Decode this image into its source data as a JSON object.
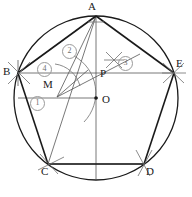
{
  "figure": {
    "type": "geometry-construction",
    "canvas": {
      "width": 192,
      "height": 197
    },
    "colors": {
      "stroke": "#1a1a1a",
      "thin": "#555555",
      "arc": "#6f6f6f",
      "circle_label": "#6f6f6f",
      "background": "#ffffff"
    },
    "circle": {
      "cx": 96,
      "cy": 98,
      "r": 82
    },
    "points": [
      {
        "name": "A",
        "label": "A",
        "x": 96,
        "y": 16,
        "label_x": 91,
        "label_y": 2,
        "dot": false
      },
      {
        "name": "B",
        "label": "B",
        "x": 18,
        "y": 73,
        "label_x": 4,
        "label_y": 68,
        "dot": false
      },
      {
        "name": "C",
        "label": "C",
        "x": 48,
        "y": 164,
        "label_x": 42,
        "label_y": 166,
        "dot": false
      },
      {
        "name": "D",
        "label": "D",
        "x": 144,
        "y": 164,
        "label_x": 147,
        "label_y": 166,
        "dot": false
      },
      {
        "name": "E",
        "label": "E",
        "x": 174,
        "y": 73,
        "label_x": 176,
        "label_y": 60,
        "dot": false
      },
      {
        "name": "O",
        "label": "O",
        "x": 96,
        "y": 98,
        "label_x": 102,
        "label_y": 99,
        "dot": true
      },
      {
        "name": "P",
        "label": "P",
        "x": 96,
        "y": 74,
        "label_x": 101,
        "label_y": 71,
        "dot": false
      },
      {
        "name": "M",
        "label": "M",
        "x": 57,
        "y": 95,
        "label_x": 44,
        "label_y": 81,
        "dot": false
      }
    ],
    "step_numbers": [
      {
        "label": "①",
        "text": "1",
        "x": 36,
        "y": 99
      },
      {
        "label": "②",
        "text": "2",
        "x": 68,
        "y": 47
      },
      {
        "label": "③",
        "text": "3",
        "x": 124,
        "y": 59
      },
      {
        "label": "④",
        "text": "4",
        "x": 43,
        "y": 65
      }
    ],
    "segments": [
      {
        "name": "pentagon-edge-AB",
        "from": "A",
        "to": "B",
        "weight": "thick"
      },
      {
        "name": "pentagon-edge-BC",
        "from": "B",
        "to": "C",
        "weight": "thick"
      },
      {
        "name": "pentagon-edge-CD",
        "from": "C",
        "to": "D",
        "weight": "thick"
      },
      {
        "name": "pentagon-edge-DE",
        "from": "D",
        "to": "E",
        "weight": "thick"
      },
      {
        "name": "pentagon-edge-EA",
        "from": "E",
        "to": "A",
        "weight": "thick"
      },
      {
        "name": "vertical-axis-AO",
        "from": "A",
        "to": "bottom",
        "weight": "thin"
      },
      {
        "name": "chord-BE",
        "from": "B",
        "to": "E",
        "weight": "thin"
      },
      {
        "name": "radius-horizontal-left",
        "from": "left-circle",
        "to": "O",
        "weight": "thin"
      },
      {
        "name": "segment-AM",
        "from": "A",
        "to": "M",
        "weight": "thin"
      },
      {
        "name": "segment-MP-extended",
        "from": "M",
        "to": "beyond-P",
        "weight": "thin"
      },
      {
        "name": "segment-AC",
        "from": "A",
        "to": "C",
        "weight": "thin"
      },
      {
        "name": "segment-PE",
        "from": "P",
        "to": "E",
        "weight": "thin"
      }
    ],
    "construction_arcs": [
      {
        "name": "arc-centered-M-through-P",
        "center": "M"
      },
      {
        "name": "arc-cross-at-B"
      },
      {
        "name": "arc-cross-at-C"
      },
      {
        "name": "arc-cross-at-D"
      },
      {
        "name": "arc-cross-at-E"
      },
      {
        "name": "arc-cross-step-3"
      },
      {
        "name": "arc-sweep-near-4"
      }
    ]
  }
}
